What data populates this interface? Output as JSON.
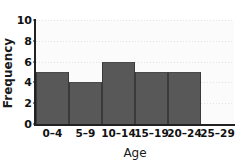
{
  "chart_data": {
    "type": "bar",
    "title": "",
    "subtitle": "",
    "xlabel": "Age",
    "ylabel": "Frequency",
    "categories": [
      "0–4",
      "5–9",
      "10–14",
      "15–19",
      "20–24",
      "25–29"
    ],
    "values": [
      5,
      4,
      6,
      5,
      5,
      0
    ],
    "series": [
      {
        "name": "Frequency",
        "values": [
          5,
          4,
          6,
          5,
          5,
          0
        ]
      }
    ],
    "ylim": [
      0,
      10
    ],
    "ytick_labels": [
      "0",
      "2",
      "4",
      "6",
      "8",
      "10"
    ],
    "ytick_values": [
      0,
      2,
      4,
      6,
      8,
      10
    ],
    "grid": "horizontal-dotted",
    "legend": "none",
    "bar_color": "#585858",
    "plot_background": "#fbfbfb",
    "axis_color": "#222222",
    "gridline_color": "#e3e3e3",
    "text_color": "#111111"
  }
}
